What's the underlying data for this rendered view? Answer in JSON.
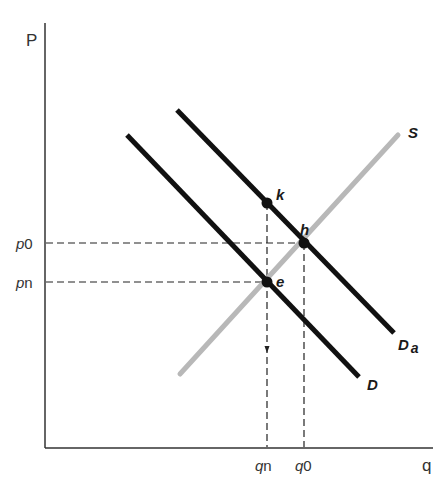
{
  "diagram": {
    "type": "supply-demand",
    "axes": {
      "y_label": "P",
      "x_label": "q"
    },
    "price_ticks": [
      {
        "id": "p0",
        "prefix": "p",
        "suffix": "0"
      },
      {
        "id": "pn",
        "prefix": "p",
        "suffix": "n"
      }
    ],
    "quantity_ticks": [
      {
        "id": "qn",
        "prefix": "q",
        "suffix": "n"
      },
      {
        "id": "q0",
        "prefix": "q",
        "suffix": "0"
      }
    ],
    "curves": [
      {
        "id": "S",
        "label": "S",
        "kind": "supply",
        "color": "#b5b5b5"
      },
      {
        "id": "D",
        "label": "D",
        "kind": "demand",
        "color": "#111111"
      },
      {
        "id": "Da",
        "label": "D",
        "sub": "a",
        "kind": "demand-shifted",
        "color": "#111111"
      }
    ],
    "points": [
      {
        "id": "k",
        "label": "k",
        "on": [
          "Da"
        ],
        "at": "qn"
      },
      {
        "id": "h",
        "label": "h",
        "on": [
          "Da",
          "S"
        ],
        "at": "q0,p0"
      },
      {
        "id": "e",
        "label": "e",
        "on": [
          "D",
          "S"
        ],
        "at": "qn,pn"
      }
    ],
    "colors": {
      "axis": "#333333",
      "demand": "#111111",
      "supply": "#b5b5b5",
      "dashed_guides": "#222222"
    }
  }
}
